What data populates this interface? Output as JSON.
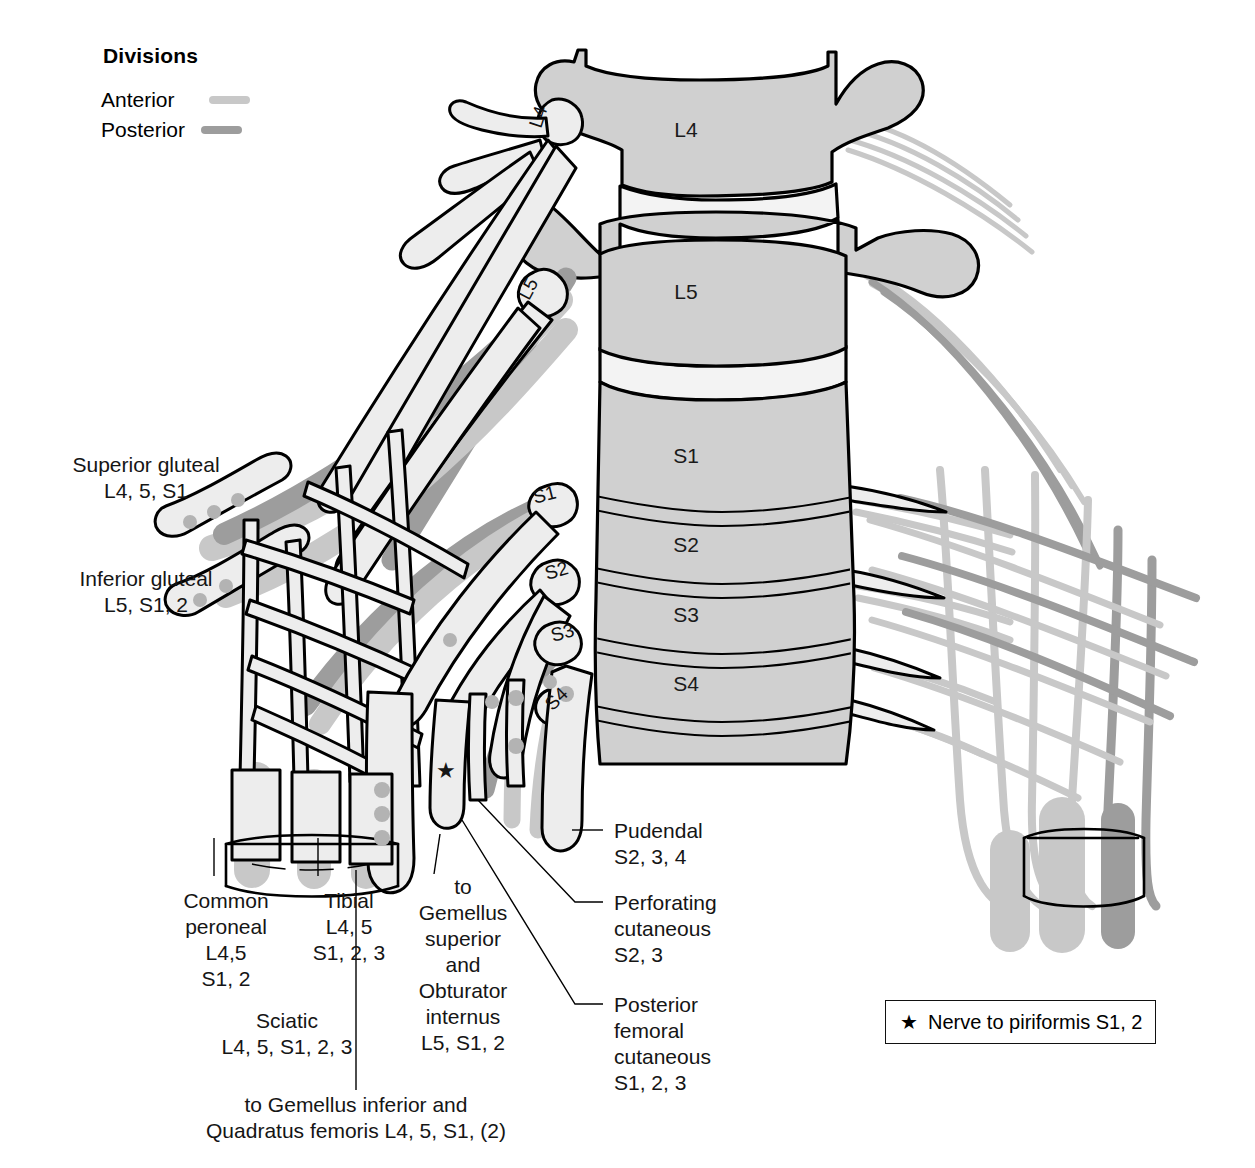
{
  "figure": {
    "colors": {
      "anterior_division": "#c8c8c8",
      "posterior_division": "#9d9d9d",
      "bone_fill": "#d0d0d0",
      "disc_fill": "#f2f2f2",
      "nerve_outline": "#111111",
      "nerve_fill": "#ececec",
      "background": "#ffffff"
    }
  },
  "legend": {
    "title": "Divisions",
    "items": [
      {
        "label": "Anterior",
        "swatch": "anterior-division-swatch"
      },
      {
        "label": "Posterior",
        "swatch": "posterior-division-swatch"
      }
    ]
  },
  "star_key": {
    "symbol": "★",
    "text": "Nerve to piriformis S1, 2"
  },
  "vertebrae": [
    {
      "id": "L4",
      "label": "L4"
    },
    {
      "id": "L5",
      "label": "L5"
    },
    {
      "id": "S1",
      "label": "S1"
    },
    {
      "id": "S2",
      "label": "S2"
    },
    {
      "id": "S3",
      "label": "S3"
    },
    {
      "id": "S4",
      "label": "S4"
    }
  ],
  "nerve_roots": [
    {
      "id": "L4",
      "label": "L4"
    },
    {
      "id": "L5",
      "label": "L5"
    },
    {
      "id": "S1",
      "label": "S1"
    },
    {
      "id": "S2",
      "label": "S2"
    },
    {
      "id": "S3",
      "label": "S3"
    },
    {
      "id": "S4",
      "label": "S4"
    }
  ],
  "labels": {
    "superior_gluteal": {
      "name": "Superior gluteal",
      "roots": "L4, 5, S1"
    },
    "inferior_gluteal": {
      "name": "Inferior gluteal",
      "roots": "L5, S1, 2"
    },
    "common_peroneal": {
      "line1": "Common",
      "line2": "peroneal",
      "line3": "L4,5",
      "line4": "S1, 2"
    },
    "tibial": {
      "line1": "Tibial",
      "line2": "L4, 5",
      "line3": "S1, 2, 3"
    },
    "sciatic": {
      "name": "Sciatic",
      "roots": "L4, 5, S1, 2, 3"
    },
    "gemellus_superior": {
      "line1": "to",
      "line2": "Gemellus",
      "line3": "superior",
      "line4": "and",
      "line5": "Obturator",
      "line6": "internus",
      "line7": "L5, S1, 2"
    },
    "gemellus_inferior": {
      "line1": "to Gemellus inferior and",
      "line2": "Quadratus femoris L4, 5, S1, (2)"
    },
    "pudendal": {
      "line1": "Pudendal",
      "line2": "S2, 3, 4"
    },
    "perforating_cutaneous": {
      "line1": "Perforating",
      "line2": "cutaneous",
      "line3": "S2, 3"
    },
    "posterior_femoral_cutaneous": {
      "line1": "Posterior",
      "line2": "femoral",
      "line3": "cutaneous",
      "line4": "S1, 2, 3"
    }
  }
}
